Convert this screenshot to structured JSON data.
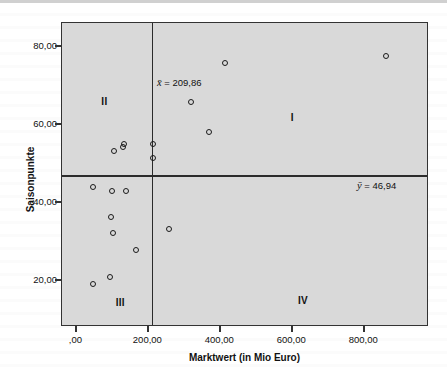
{
  "chart_data": {
    "type": "scatter",
    "title": "",
    "xlabel": "Marktwert (in Mio Euro)",
    "ylabel": "Saisonpunkte",
    "xlim": [
      -40,
      980
    ],
    "ylim": [
      8,
      86
    ],
    "xticks": [
      0,
      200,
      400,
      600,
      800
    ],
    "xtick_labels": [
      ",00",
      "200,00",
      "400,00",
      "600,00",
      "800,00"
    ],
    "yticks": [
      20,
      40,
      60,
      80
    ],
    "ytick_labels": [
      "20,00",
      "40,00",
      "60,00",
      "80,00"
    ],
    "grid": false,
    "legend": "none",
    "reference_lines": [
      {
        "name": "x-mean",
        "orientation": "vertical",
        "value": 209.86,
        "label": "x̄ = 209,86"
      },
      {
        "name": "y-mean",
        "orientation": "horizontal",
        "value": 46.94,
        "label": "ȳ = 46,94"
      }
    ],
    "annotations": [
      {
        "name": "x-mean-label",
        "symbol": "x̄",
        "text": " = 209,86"
      },
      {
        "name": "y-mean-label",
        "symbol": "ȳ",
        "text": " = 46,94"
      }
    ],
    "quadrant_labels": [
      {
        "name": "quadrant-I",
        "label": "I",
        "x": 600,
        "y": 62
      },
      {
        "name": "quadrant-II",
        "label": "II",
        "x": 78,
        "y": 66
      },
      {
        "name": "quadrant-III",
        "label": "III",
        "x": 122,
        "y": 14.5
      },
      {
        "name": "quadrant-IV",
        "label": "IV",
        "x": 630,
        "y": 14.8
      }
    ],
    "points": [
      {
        "x": 860,
        "y": 77.5
      },
      {
        "x": 412,
        "y": 75.8
      },
      {
        "x": 318,
        "y": 65.8
      },
      {
        "x": 368,
        "y": 58.0
      },
      {
        "x": 212,
        "y": 55.0
      },
      {
        "x": 133,
        "y": 55.0
      },
      {
        "x": 130,
        "y": 54.2
      },
      {
        "x": 104,
        "y": 53.2
      },
      {
        "x": 212,
        "y": 51.3
      },
      {
        "x": 45,
        "y": 43.8
      },
      {
        "x": 100,
        "y": 42.8
      },
      {
        "x": 137,
        "y": 42.8
      },
      {
        "x": 95,
        "y": 36.2
      },
      {
        "x": 258,
        "y": 33.2
      },
      {
        "x": 103,
        "y": 32.2
      },
      {
        "x": 165,
        "y": 27.8
      },
      {
        "x": 94,
        "y": 20.8
      },
      {
        "x": 47,
        "y": 19.0
      }
    ]
  },
  "axis": {
    "y_title": "Saisonpunkte",
    "x_title": "Marktwert (in Mio Euro)"
  }
}
